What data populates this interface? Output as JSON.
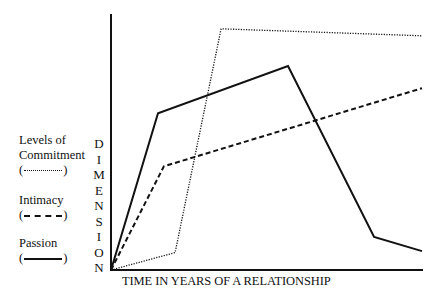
{
  "chart_data": {
    "type": "line",
    "title": "",
    "xlabel": "TIME IN YEARS OF A RELATIONSHIP",
    "ylabel": "DIMENSION",
    "grid": false,
    "legend_position": "left",
    "x_ticks": [],
    "y_ticks": [],
    "xlim": [
      0,
      100
    ],
    "ylim": [
      0,
      100
    ],
    "series": [
      {
        "name": "Levels of Commitment",
        "style": "dotted",
        "points": [
          [
            0,
            0
          ],
          [
            20.6,
            6.8
          ],
          [
            35.4,
            94.2
          ],
          [
            100,
            91.5
          ]
        ]
      },
      {
        "name": "Intimacy",
        "style": "dashed",
        "points": [
          [
            0,
            0
          ],
          [
            17.0,
            40.5
          ],
          [
            100,
            71.0
          ]
        ]
      },
      {
        "name": "Passion",
        "style": "solid",
        "points": [
          [
            0,
            0
          ],
          [
            15.1,
            61.2
          ],
          [
            56.9,
            79.7
          ],
          [
            84.6,
            12.9
          ],
          [
            100,
            7.4
          ]
        ]
      }
    ],
    "annotations": []
  },
  "axes": {
    "ylabel_letters": [
      "D",
      "I",
      "M",
      "E",
      "N",
      "S",
      "I",
      "O",
      "N"
    ],
    "xlabel": "TIME IN YEARS OF A RELATIONSHIP"
  },
  "legend": {
    "items": [
      {
        "label_line1": "Levels of",
        "label_line2": "Commitment",
        "open": "(",
        "close": ")"
      },
      {
        "label_line1": "Intimacy",
        "open": "(",
        "close": ")"
      },
      {
        "label_line1": "Passion",
        "open": "(",
        "close": ")"
      }
    ]
  },
  "colors": {
    "line": "#111111",
    "background": "#ffffff"
  }
}
